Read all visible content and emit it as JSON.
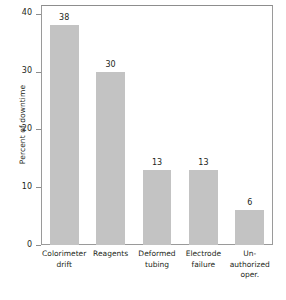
{
  "chart_data": {
    "type": "bar",
    "title": "",
    "subtitle": "",
    "xlabel": "",
    "ylabel": "Percent of downtime",
    "ylim": [
      0,
      41.5
    ],
    "yticks": [
      0,
      10,
      20,
      30,
      40
    ],
    "ytick_labels": [
      "0",
      "10",
      "20",
      "30",
      "40"
    ],
    "grid": false,
    "legend": false,
    "bar_color": "#c3c3c3",
    "frame_color": "#9a9a9a",
    "text_color": "#231f20",
    "show_value_labels": true,
    "categories": [
      "Colorimeter drift",
      "Reagents",
      "Deformed tubing",
      "Electrode failure",
      "Un-authorized oper."
    ],
    "category_lines": [
      [
        "Colorimeter",
        "drift"
      ],
      [
        "Reagents"
      ],
      [
        "Deformed",
        "tubing"
      ],
      [
        "Electrode",
        "failure"
      ],
      [
        "Un-",
        "authorized",
        "oper."
      ]
    ],
    "values": [
      38,
      30,
      13,
      13,
      6
    ],
    "value_labels": [
      "38",
      "30",
      "13",
      "13",
      "6"
    ]
  }
}
